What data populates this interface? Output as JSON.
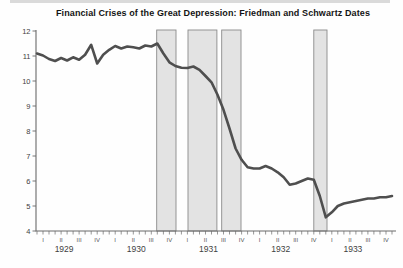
{
  "title": "Financial Crises of the Great Depression: Friedman and Schwartz Dates",
  "colors": {
    "line": "#4f4f4f",
    "band_fill": "#e3e3e3",
    "band_border": "#8a8a8a",
    "axis": "#6a6a6a",
    "tick_text": "#3f3f3f",
    "quarter_text": "#555555",
    "title_text": "#141414",
    "background": "#fefefe"
  },
  "chart_data": {
    "type": "line",
    "title": "Financial Crises of the Great Depression: Friedman and Schwartz Dates",
    "x_unit": "month",
    "x_start": "1929-01",
    "x_end": "1933-12",
    "ylim": [
      4,
      12
    ],
    "y_ticks": [
      4,
      5,
      6,
      7,
      8,
      9,
      10,
      11,
      12
    ],
    "x_axis": {
      "years": [
        "1929",
        "1930",
        "1931",
        "1932",
        "1933"
      ],
      "quarter_labels": [
        "I",
        "II",
        "III",
        "IV"
      ]
    },
    "grid": false,
    "legend": false,
    "series": [
      {
        "values": [
          11.1,
          11.02,
          10.88,
          10.8,
          10.92,
          10.82,
          10.95,
          10.85,
          11.05,
          11.45,
          10.7,
          11.05,
          11.25,
          11.4,
          11.3,
          11.38,
          11.35,
          11.3,
          11.42,
          11.38,
          11.5,
          11.1,
          10.75,
          10.6,
          10.53,
          10.52,
          10.58,
          10.45,
          10.2,
          9.95,
          9.45,
          8.85,
          8.1,
          7.3,
          6.85,
          6.55,
          6.5,
          6.5,
          6.6,
          6.5,
          6.35,
          6.15,
          5.85,
          5.9,
          6.0,
          6.1,
          6.05,
          5.4,
          4.55,
          4.75,
          5.0,
          5.1,
          5.15,
          5.2,
          5.25,
          5.3,
          5.3,
          5.35,
          5.35,
          5.4
        ]
      }
    ],
    "crisis_bands": [
      {
        "from_month": 19.9,
        "to_month": 23.1
      },
      {
        "from_month": 25.1,
        "to_month": 29.9
      },
      {
        "from_month": 30.7,
        "to_month": 33.9
      },
      {
        "from_month": 46.0,
        "to_month": 48.2
      }
    ]
  }
}
